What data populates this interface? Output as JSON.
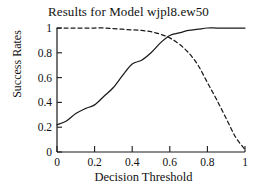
{
  "chart_data": {
    "type": "line",
    "title": "Results for Model wjpl8.ew50",
    "xlabel": "Decision Threshold",
    "ylabel": "Success Rates",
    "xlim": [
      0,
      1
    ],
    "ylim": [
      0,
      1
    ],
    "grid": false,
    "legend": "none",
    "xticks": [
      "0",
      "0.2",
      "0.4",
      "0.6",
      "0.8",
      "1"
    ],
    "xtick_values": [
      0,
      0.2,
      0.4,
      0.6,
      0.8,
      1
    ],
    "yticks": [
      "0",
      "0.2",
      "0.4",
      "0.6",
      "0.8",
      "1"
    ],
    "ytick_values": [
      0,
      0.2,
      0.4,
      0.6,
      0.8,
      1
    ],
    "x": [
      0,
      0.05,
      0.1,
      0.15,
      0.2,
      0.25,
      0.3,
      0.35,
      0.4,
      0.45,
      0.5,
      0.55,
      0.6,
      0.65,
      0.7,
      0.75,
      0.8,
      0.85,
      0.9,
      0.95,
      1
    ],
    "series": [
      {
        "name": "solid-rising-curve",
        "style": "solid",
        "color": "#1a1a1a",
        "values": [
          0.22,
          0.25,
          0.31,
          0.35,
          0.38,
          0.45,
          0.52,
          0.62,
          0.71,
          0.74,
          0.8,
          0.88,
          0.94,
          0.96,
          0.98,
          0.99,
          1.0,
          1.0,
          1.0,
          1.0,
          1.0
        ]
      },
      {
        "name": "dashed-falling-curve",
        "style": "dashed",
        "color": "#1a1a1a",
        "values": [
          1.0,
          1.0,
          1.0,
          1.0,
          1.0,
          1.0,
          0.995,
          0.99,
          0.985,
          0.98,
          0.97,
          0.95,
          0.92,
          0.87,
          0.8,
          0.7,
          0.56,
          0.42,
          0.27,
          0.12,
          0.02
        ]
      }
    ]
  }
}
